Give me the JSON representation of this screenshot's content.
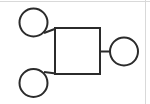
{
  "diagram": {
    "type": "pedigree-chart",
    "background_color": "#ffffff",
    "stroke_color": "#2b2b2b",
    "stroke_width": 2,
    "border_color": "#d9d9d9",
    "canvas": {
      "width": 150,
      "height": 104
    },
    "nodes": [
      {
        "id": "circle-top-left",
        "shape": "circle",
        "label": "",
        "cx": 33.5,
        "cy": 22.5,
        "r": 14
      },
      {
        "id": "square-center",
        "shape": "square",
        "label": "",
        "x": 55,
        "y": 28,
        "width": 45,
        "height": 46
      },
      {
        "id": "circle-right",
        "shape": "circle",
        "label": "",
        "cx": 124,
        "cy": 51.5,
        "r": 14
      },
      {
        "id": "circle-bottom-left",
        "shape": "circle",
        "label": "",
        "cx": 33.5,
        "cy": 83,
        "r": 14
      }
    ],
    "links": [
      {
        "id": "link-top-left-to-square",
        "from": "circle-top-left",
        "to": "square-center",
        "orientation": "diagonal",
        "x1": 44,
        "y1": 33,
        "x2": 55,
        "y2": 28
      },
      {
        "id": "link-bottom-left-to-square",
        "from": "circle-bottom-left",
        "to": "square-center",
        "orientation": "diagonal",
        "x1": 44,
        "y1": 72,
        "x2": 55,
        "y2": 74
      },
      {
        "id": "link-square-to-right",
        "from": "square-center",
        "to": "circle-right",
        "orientation": "horizontal",
        "x1": 100,
        "y1": 51.5,
        "x2": 110,
        "y2": 51.5
      }
    ]
  }
}
